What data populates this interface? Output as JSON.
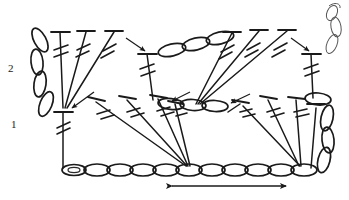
{
  "diagram": {
    "type": "crochet-symbol-chart",
    "background_color": "#ffffff",
    "ink_color": "#1a1a1a",
    "width": 349,
    "height": 200
  },
  "row_labels": [
    {
      "id": "row-2",
      "text": "2",
      "x": 10,
      "y": 68
    },
    {
      "id": "row-1",
      "text": "1",
      "x": 12,
      "y": 125
    }
  ],
  "foundation_chain": {
    "name": "foundation-chain",
    "loop_count": 11,
    "start_x": 62,
    "end_x": 316,
    "y": 170,
    "loop_width": 23,
    "loop_height": 11,
    "slip_knot_at_start": true
  },
  "repeat_arrow": {
    "name": "pattern-repeat-arrow",
    "x1": 170,
    "x2": 288,
    "y": 185,
    "double_headed": true,
    "meaning": "pattern repeat"
  },
  "turning_chain_left": {
    "name": "turning-chain-left",
    "loop_count": 4,
    "x": 40,
    "top_y": 32,
    "bottom_y": 112,
    "orientation": "vertical"
  },
  "turning_chain_right": {
    "name": "turning-chain-right",
    "loop_count": 4,
    "x": 324,
    "top_y": 92,
    "bottom_y": 172,
    "orientation": "vertical"
  },
  "chain_arc_upper_middle": {
    "name": "chain-arc-upper-middle",
    "loop_count": 4,
    "from_x": 158,
    "from_y": 52,
    "to_x": 232,
    "to_y": 34
  },
  "chain_arc_row1_middle": {
    "name": "chain-arc-row1-middle",
    "loop_count": 4,
    "from_x": 160,
    "from_y": 103,
    "to_x": 222,
    "to_y": 105
  },
  "yarn_tail": {
    "name": "yarn-tail-top-right",
    "description": "loose yarn end curling above right edge",
    "x": 330,
    "y_top": 4,
    "y_bottom": 52
  },
  "row1": {
    "name": "row-1-stitches",
    "label": "1",
    "stitch_symbol": "double-treble-crochet",
    "fan_clusters": [
      {
        "name": "row1-fan-left",
        "apex_x": 186,
        "apex_y": 164,
        "stitch_tops": [
          [
            95,
            100
          ],
          [
            125,
            98
          ],
          [
            155,
            96
          ],
          [
            172,
            100
          ]
        ]
      },
      {
        "name": "row1-fan-right",
        "apex_x": 300,
        "apex_y": 164,
        "stitch_tops": [
          [
            240,
            100
          ],
          [
            268,
            98
          ],
          [
            296,
            98
          ],
          [
            312,
            100
          ]
        ]
      }
    ],
    "anchor_stitch": {
      "name": "row1-anchor-left",
      "x": 62,
      "top_y": 110,
      "bottom_y": 170
    },
    "edge_stitch": {
      "name": "row1-edge-right",
      "x": 316,
      "top_y": 108,
      "bottom_y": 170
    }
  },
  "row2": {
    "name": "row-2-stitches",
    "label": "2",
    "stitch_symbol": "double-treble-crochet",
    "fan_clusters": [
      {
        "name": "row2-fan-left",
        "apex_x": 63,
        "apex_y": 110,
        "stitch_tops": [
          [
            58,
            32
          ],
          [
            85,
            30
          ],
          [
            113,
            30
          ]
        ]
      },
      {
        "name": "row2-fan-right",
        "apex_x": 193,
        "apex_y": 105,
        "stitch_tops": [
          [
            230,
            32
          ],
          [
            258,
            30
          ],
          [
            285,
            30
          ]
        ]
      }
    ],
    "valley_stitches": [
      {
        "name": "row2-valley-left",
        "x": 147,
        "top_y": 52,
        "bottom_y": 98
      },
      {
        "name": "row2-valley-right",
        "x": 310,
        "top_y": 52,
        "bottom_y": 96
      }
    ]
  },
  "direction_arrows": [
    {
      "name": "arrow-into-row1-anchor",
      "x1": 92,
      "y1": 93,
      "x2": 70,
      "y2": 108
    },
    {
      "name": "arrow-into-row2-valley-left",
      "x1": 128,
      "y1": 38,
      "x2": 146,
      "y2": 52
    },
    {
      "name": "arrow-into-row2-valley-right",
      "x1": 293,
      "y1": 38,
      "x2": 310,
      "y2": 52
    },
    {
      "name": "arrow-into-row1-middle",
      "x1": 188,
      "y1": 92,
      "x2": 170,
      "y2": 103
    },
    {
      "name": "arrow-into-row1-right",
      "x1": 248,
      "y1": 94,
      "x2": 230,
      "y2": 104
    }
  ],
  "legend": {
    "symbols": [
      {
        "name": "double-treble-symbol",
        "label": "double treble crochet"
      },
      {
        "name": "chain-loop-symbol",
        "label": "chain stitch"
      },
      {
        "name": "repeat-arrow-symbol",
        "label": "repeat section"
      }
    ]
  }
}
